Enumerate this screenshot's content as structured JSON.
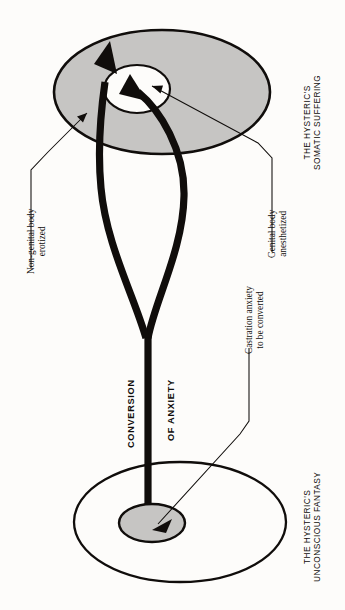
{
  "figure": {
    "title_alt": "Conversion of anxiety in hysteria",
    "background_color": "#fdfcfa",
    "ink_color": "#100d0b",
    "gray_fill": "#c6c5c3",
    "white_fill": "#fdfcfa"
  },
  "labels": {
    "somatic_heading": {
      "line1": "THE HYSTERIC'S",
      "line2": "SOMATIC SUFFERING"
    },
    "fantasy_heading": {
      "line1": "THE HYSTERIC'S",
      "line2": "UNCONSCIOUS FANTASY"
    },
    "nongenital": {
      "line1": "Non-genital body",
      "line2": "erotized"
    },
    "genital": {
      "line1": "Genital body",
      "line2": "anesthetized"
    },
    "castration": {
      "line1": "Castration anxiety",
      "line2": "to be converted"
    },
    "conversion": "CONVERSION",
    "of_anxiety": "OF ANXIETY"
  },
  "shapes": {
    "upper_plane": {
      "name": "somatic-body-plane",
      "fill": "#c6c5c3",
      "cx": 162,
      "cy": 92,
      "rx": 108,
      "ry": 62
    },
    "upper_inner": {
      "name": "genital-zone-anesthetized",
      "fill": "#fdfcfa",
      "cx": 137,
      "cy": 89,
      "rx": 33,
      "ry": 24
    },
    "lower_plane": {
      "name": "unconscious-fantasy-plane",
      "fill": "#fdfcfa",
      "cx": 180,
      "cy": 522,
      "rx": 106,
      "ry": 60
    },
    "lower_inner": {
      "name": "castration-anxiety-core",
      "fill": "#c6c5c3",
      "cx": 152,
      "cy": 523,
      "rx": 33,
      "ry": 19
    }
  },
  "arrows": {
    "thick_left": {
      "name": "conversion-arrow-nongenital",
      "description": "thick arrow from stem rising to upper-left of body plane"
    },
    "thick_right": {
      "name": "conversion-arrow-genital",
      "description": "thick arrow from stem curving to genital zone"
    },
    "stem": {
      "name": "conversion-stem",
      "description": "thick vertical trunk from fantasy core to fork"
    },
    "leader_nongenital": {
      "name": "leader-line-nongenital"
    },
    "leader_genital": {
      "name": "leader-line-genital"
    },
    "leader_castration": {
      "name": "leader-line-castration"
    }
  }
}
